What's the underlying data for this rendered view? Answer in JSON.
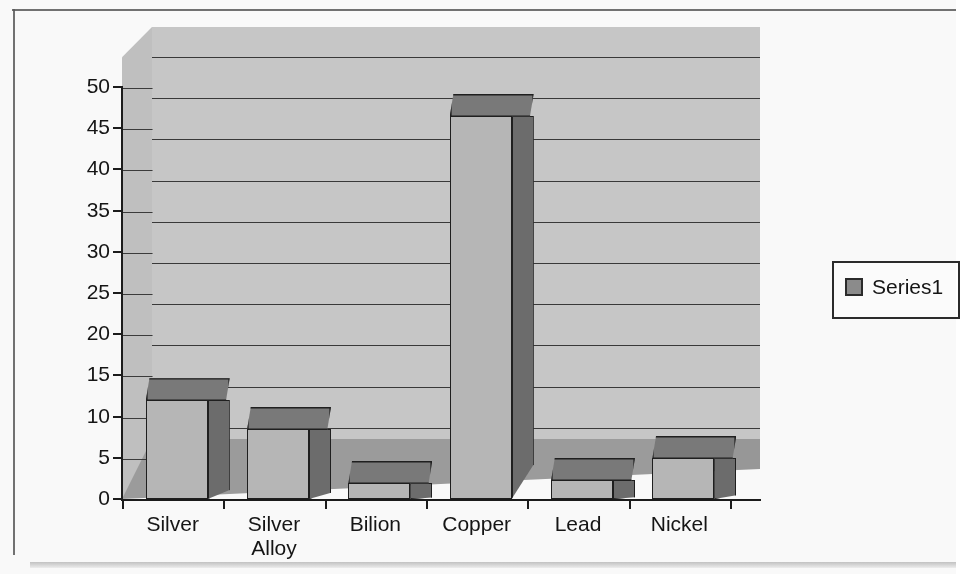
{
  "chart_data": {
    "type": "bar",
    "title": "",
    "subtitle": "",
    "xlabel": "",
    "ylabel": "",
    "categories": [
      "Silver",
      "Silver Alloy",
      "Bilion",
      "Copper",
      "Lead",
      "Nickel"
    ],
    "category_lines": [
      [
        "Silver"
      ],
      [
        "Silver",
        "Alloy"
      ],
      [
        "Bilion"
      ],
      [
        "Copper"
      ],
      [
        "Lead"
      ],
      [
        "Nickel"
      ]
    ],
    "series": [
      {
        "name": "Series1",
        "values": [
          12,
          8.5,
          2,
          46.5,
          2.3,
          5
        ]
      }
    ],
    "values": [
      12,
      8.5,
      2,
      46.5,
      2.3,
      5
    ],
    "ylim": [
      0,
      50
    ],
    "y_ticks": [
      0,
      5,
      10,
      15,
      20,
      25,
      30,
      35,
      40,
      45,
      50
    ],
    "y_tick_labels": [
      "0",
      "5",
      "10",
      "15",
      "20",
      "25",
      "30",
      "35",
      "40",
      "45",
      "50"
    ],
    "grid": true,
    "grid_axis": "y",
    "legend": {
      "position": "right",
      "entries": [
        {
          "label": "Series1",
          "swatch_color": "#8d8d8d"
        }
      ]
    },
    "style": {
      "three_d": true,
      "bar_front_color": "#b9b9b9",
      "bar_side_color": "#6e6e6e",
      "bar_top_color": "#7b7b7b",
      "bar_outline_color": "#1f1f1f",
      "wall_color": "#c9c9c9",
      "floor_color": "#9e9e9e",
      "axis_color": "#1c1c1c",
      "background_color": "#fdfdfd"
    }
  }
}
